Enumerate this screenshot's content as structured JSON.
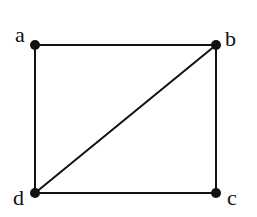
{
  "diagram": {
    "type": "graph",
    "directed": false,
    "colors": {
      "background": "#ffffff",
      "stroke": "#111111"
    },
    "nodes": [
      {
        "id": "a",
        "label": "a",
        "x": 35,
        "y": 45,
        "label_x": 15,
        "label_y": 42
      },
      {
        "id": "b",
        "label": "b",
        "x": 216,
        "y": 45,
        "label_x": 225,
        "label_y": 46
      },
      {
        "id": "c",
        "label": "c",
        "x": 216,
        "y": 193,
        "label_x": 227,
        "label_y": 205
      },
      {
        "id": "d",
        "label": "d",
        "x": 35,
        "y": 193,
        "label_x": 13,
        "label_y": 205
      }
    ],
    "edges": [
      {
        "from": "a",
        "to": "b"
      },
      {
        "from": "b",
        "to": "c"
      },
      {
        "from": "c",
        "to": "d"
      },
      {
        "from": "d",
        "to": "a"
      },
      {
        "from": "d",
        "to": "b"
      }
    ]
  }
}
